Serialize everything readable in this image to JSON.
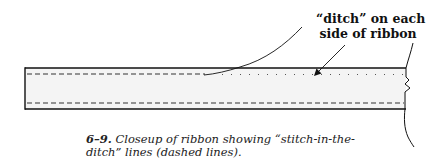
{
  "figure": {
    "callout": {
      "line1": "“ditch” on each",
      "line2": "side of ribbon"
    },
    "caption": {
      "number": "6–9.",
      "line1_text": " Closeup of ribbon showing “stitch-in-the-",
      "line2_text": "ditch” lines (dashed lines)."
    },
    "colors": {
      "ribbon_fill": "#f4f4f4",
      "stroke": "#111111"
    }
  }
}
